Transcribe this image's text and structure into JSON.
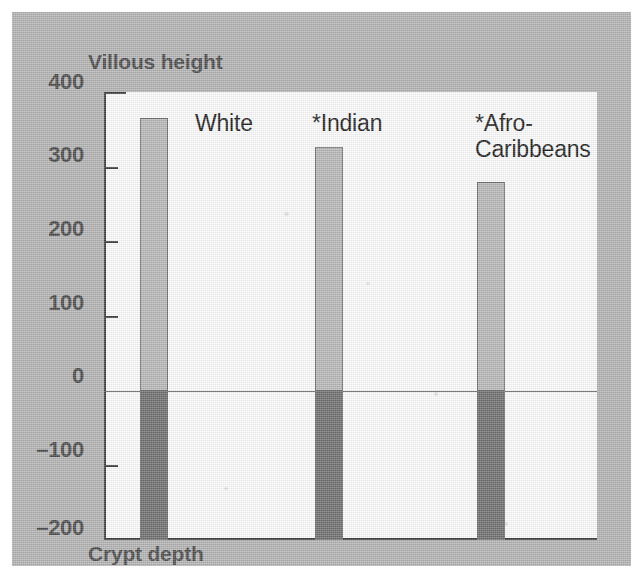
{
  "chart_data": {
    "type": "bar",
    "title": "",
    "subtitle": "",
    "xlabel": "",
    "ylabel": "",
    "upper_axis_title": "Villous height",
    "lower_axis_title": "Crypt depth",
    "categories": [
      "White",
      "*Indian",
      "*Afro-\nCaribbeans"
    ],
    "series": [
      {
        "name": "Villous height",
        "values": [
          365,
          327,
          280
        ],
        "color": "#b9b9b9"
      },
      {
        "name": "Crypt depth",
        "values": [
          -200,
          -200,
          -200
        ],
        "color": "#6f6f6f"
      }
    ],
    "ylim": [
      -200,
      400
    ],
    "yticks": [
      400,
      300,
      200,
      100,
      0,
      -100,
      -200
    ],
    "ytick_labels": [
      "400",
      "300",
      "200",
      "100",
      "0",
      "–100",
      "–200"
    ],
    "grid": false,
    "legend": "none",
    "zero_line": 0,
    "footnote": "",
    "annotations": []
  },
  "figure": {
    "background_color": "#b4b4b4",
    "plot_background_color": "#fdfdfd",
    "axis_color": "#3b3b3b",
    "tick_label_color": "#4a4a4a",
    "category_label_color": "#1c1c1c"
  }
}
